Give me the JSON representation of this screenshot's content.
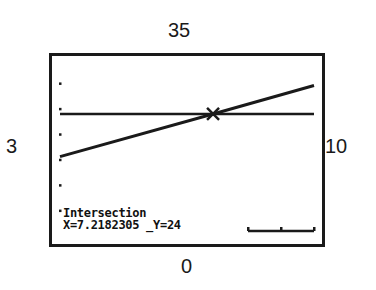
{
  "window": {
    "ymax": "35",
    "ymin": "0",
    "xmin": "3",
    "xmax": "10"
  },
  "screen": {
    "title": "Intersection",
    "x_readout": "X=7.2182305",
    "y_readout": "Y=24"
  },
  "colors": {
    "ink": "#1a1a1a",
    "background": "#ffffff"
  },
  "chart_data": {
    "type": "line",
    "title": "Intersection",
    "xlabel": "",
    "ylabel": "",
    "xlim": [
      3,
      10
    ],
    "ylim": [
      0,
      35
    ],
    "grid": false,
    "y_tick_marks": [
      5,
      10,
      15,
      20,
      25,
      30
    ],
    "series": [
      {
        "name": "Y1 (rising line)",
        "x": [
          3,
          7.2182305,
          10
        ],
        "y": [
          15.6,
          24,
          29.6
        ]
      },
      {
        "name": "Y2 (horizontal)",
        "x": [
          3,
          10
        ],
        "y": [
          24,
          24
        ]
      }
    ],
    "annotations": [
      {
        "type": "marker",
        "shape": "x",
        "x": 7.2182305,
        "y": 24,
        "text": "Intersection X=7.2182305 Y=24"
      }
    ]
  }
}
